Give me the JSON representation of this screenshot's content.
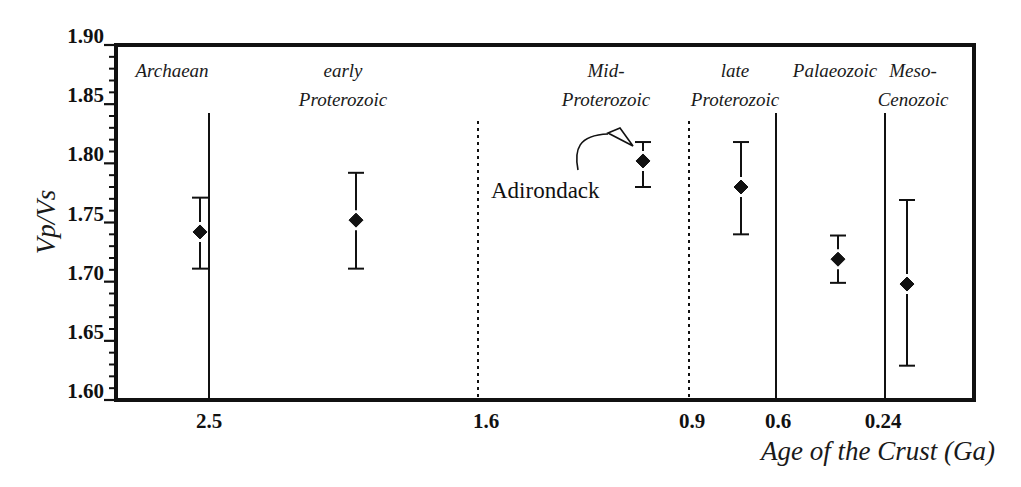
{
  "chart_data": {
    "type": "scatter",
    "title": "",
    "xlabel": "Age of the Crust (Ga)",
    "ylabel": "Vp/Vs",
    "ylim": [
      1.6,
      1.9
    ],
    "y_ticks": [
      "1.60",
      "1.65",
      "1.70",
      "1.75",
      "1.80",
      "1.85",
      "1.90"
    ],
    "y_minor_step": 0.01,
    "x_ticks": [
      "2.5",
      "1.6",
      "0.9",
      "0.6",
      "0.24"
    ],
    "grid": false,
    "legend": null,
    "boundaries": [
      {
        "age": "2.5",
        "style": "solid"
      },
      {
        "age": "1.6",
        "style": "dotted"
      },
      {
        "age": "0.9",
        "style": "dotted"
      },
      {
        "age": "0.6",
        "style": "solid"
      },
      {
        "age": "0.24",
        "style": "solid"
      }
    ],
    "categories": [
      "Archaean",
      "early Proterozoic",
      "Mid-Proterozoic",
      "late Proterozoic",
      "Palaeozoic",
      "Meso-Cenozoic"
    ],
    "series": [
      {
        "name": "Vp/Vs mean with error bars",
        "marker": "diamond",
        "values": [
          1.742,
          1.752,
          1.802,
          1.78,
          1.719,
          1.698
        ],
        "error_upper": [
          1.771,
          1.792,
          1.818,
          1.818,
          1.739,
          1.769
        ],
        "error_lower": [
          1.711,
          1.711,
          1.78,
          1.74,
          1.699,
          1.629
        ]
      }
    ],
    "annotations": [
      {
        "text": "Adirondack",
        "points_to": "Mid-Proterozoic"
      }
    ]
  },
  "eras": [
    {
      "line1": "Archaean",
      "line2": ""
    },
    {
      "line1": "early",
      "line2": "Proterozoic"
    },
    {
      "line1": "Mid-",
      "line2": "Proterozoic"
    },
    {
      "line1": "late",
      "line2": "Proterozoic"
    },
    {
      "line1": "Palaeozoic",
      "line2": ""
    },
    {
      "line1": "Meso-",
      "line2": "Cenozoic"
    }
  ]
}
